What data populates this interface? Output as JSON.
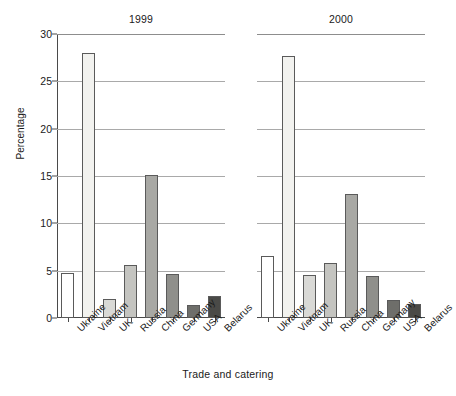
{
  "chart_data": {
    "type": "bar",
    "title": "",
    "xlabel": "Trade and catering",
    "ylabel": "Percentage",
    "ylim": [
      0,
      30
    ],
    "yticks": [
      0,
      5,
      10,
      15,
      20,
      25,
      30
    ],
    "ytick_labels": [
      "0",
      "5",
      "10",
      "15",
      "20",
      "25",
      "30"
    ],
    "grid": true,
    "legend": "none",
    "categories": [
      "Ukraine",
      "Vietnam",
      "UK",
      "Russia",
      "China",
      "Germany",
      "USA",
      "Belarus"
    ],
    "panels": [
      {
        "label": "1999",
        "values": [
          4.8,
          28.0,
          2.0,
          5.6,
          15.1,
          4.7,
          1.4,
          2.3
        ]
      },
      {
        "label": "2000",
        "values": [
          6.6,
          27.7,
          4.5,
          5.8,
          13.1,
          4.4,
          1.9,
          1.5
        ]
      }
    ],
    "bar_colors": [
      "#ffffff",
      "#f2f2ef",
      "#d9d9d6",
      "#c4c4c0",
      "#a8a8a4",
      "#8f8f8b",
      "#6e6e6a",
      "#4a4a47"
    ],
    "bar_edge_color": "#5a5a5a",
    "grid_color": "#a9a9a9",
    "axis_color": "#4a4a4a",
    "background": "#ffffff"
  }
}
